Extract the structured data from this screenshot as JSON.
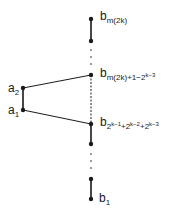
{
  "diagram": {
    "type": "poset-chain-diagram",
    "nodes": {
      "b_top": {
        "base": "b",
        "subscript": "m(2k)"
      },
      "b_mid_upper": {
        "base": "b",
        "subscript": "m(2k)+1−2",
        "sup": "k−3"
      },
      "b_mid_lower": {
        "base": "b",
        "subscript_parts": [
          "2",
          "k−1",
          "+2",
          "k−2",
          "+2",
          "k−3"
        ]
      },
      "b_bottom": {
        "base": "b",
        "subscript": "1"
      },
      "a2": {
        "base": "a",
        "subscript": "2"
      },
      "a1": {
        "base": "a",
        "subscript": "1"
      }
    },
    "labels": {
      "b_top": "b",
      "b_top_sub": "m(2k)",
      "b_upper_base": "b",
      "b_upper_sub": "m(2k)+1−2",
      "b_upper_sup": "k−3",
      "b_lower_base": "b",
      "b_lower_sub1": "2",
      "b_lower_sup1": "k−1",
      "b_lower_sub2": "+2",
      "b_lower_sup2": "k−2",
      "b_lower_sub3": "+2",
      "b_lower_sup3": "k−3",
      "b1_base": "b",
      "b1_sub": "1",
      "a2_base": "a",
      "a2_sub": "2",
      "a1_base": "a",
      "a1_sub": "1"
    },
    "edges": [
      [
        "b_top",
        "b_node2",
        "solid"
      ],
      [
        "b_node2",
        "b_mid_upper",
        "dotted"
      ],
      [
        "b_mid_upper",
        "b_mid_lower",
        "dashed"
      ],
      [
        "b_mid_lower",
        "b_node5",
        "solid"
      ],
      [
        "b_node5",
        "b_node6",
        "dotted"
      ],
      [
        "b_node6",
        "b_bottom",
        "solid"
      ],
      [
        "a2",
        "a1",
        "solid"
      ],
      [
        "a2",
        "b_mid_upper",
        "solid"
      ],
      [
        "a1",
        "b_mid_lower",
        "solid"
      ]
    ],
    "colors": {
      "ink": "#1a1a1a",
      "background": "#ffffff"
    }
  }
}
